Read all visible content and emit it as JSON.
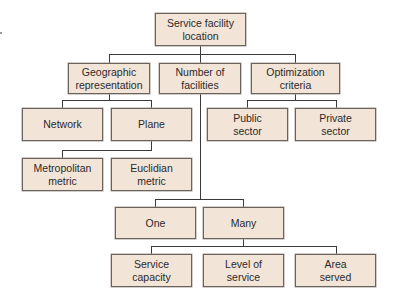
{
  "diagram": {
    "type": "hierarchy",
    "colors": {
      "box_fill": "#f3e4d8",
      "box_border": "#6a625c",
      "line": "#3a3a3a"
    },
    "root": {
      "label": "Service facility\nlocation"
    },
    "level2": [
      {
        "label": "Geographic\nrepresentation"
      },
      {
        "label": "Number of\nfacilities"
      },
      {
        "label": "Optimization\ncriteria"
      }
    ],
    "geographic_children": [
      {
        "label": "Network"
      },
      {
        "label": "Plane"
      }
    ],
    "plane_children": [
      {
        "label": "Metropolitan\nmetric"
      },
      {
        "label": "Euclidian\nmetric"
      }
    ],
    "optimization_children": [
      {
        "label": "Public\nsector"
      },
      {
        "label": "Private\nsector"
      }
    ],
    "facilities_children": [
      {
        "label": "One"
      },
      {
        "label": "Many"
      }
    ],
    "many_children": [
      {
        "label": "Service\ncapacity"
      },
      {
        "label": "Level of\nservice"
      },
      {
        "label": "Area\nserved"
      }
    ]
  }
}
